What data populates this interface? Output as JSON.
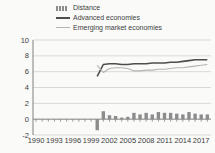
{
  "chart": {
    "background_color": "#fafaf9",
    "text_color": "#3d3d3d",
    "grid_color": "#d9d9d9",
    "axis_color": "#808080"
  },
  "chart_data": {
    "type": "bar+line combo",
    "title": "",
    "xlabel": "",
    "ylabel": "",
    "legend_position": "top-left",
    "grid": true,
    "x_axis": {
      "min": 1990,
      "max": 2018,
      "tick_labels": [
        "1990",
        "1993",
        "1996",
        "1999",
        "2002",
        "2005",
        "2008",
        "2011",
        "2014",
        "2017"
      ],
      "tick_step": 3
    },
    "y_axis": {
      "min": -2,
      "max": 10,
      "tick_step": 2,
      "tick_labels": [
        "-2",
        "0",
        "2",
        "4",
        "6",
        "8",
        "10"
      ]
    },
    "x": [
      2000,
      2001,
      2002,
      2003,
      2004,
      2005,
      2006,
      2007,
      2008,
      2009,
      2010,
      2011,
      2012,
      2013,
      2014,
      2015,
      2016,
      2017,
      2018
    ],
    "series": [
      {
        "name": "Distance",
        "type": "bar",
        "color": "#8c8c8c",
        "values": [
          -1.4,
          1.0,
          0.5,
          0.4,
          0.2,
          0.3,
          0.8,
          0.6,
          0.8,
          0.6,
          0.9,
          0.8,
          0.8,
          0.7,
          0.6,
          0.9,
          0.7,
          0.6,
          0.6
        ]
      },
      {
        "name": "Advanced economies",
        "type": "line",
        "color": "#4d4d4d",
        "values": [
          5.4,
          6.9,
          7.0,
          7.0,
          6.9,
          6.9,
          7.0,
          7.0,
          7.0,
          7.1,
          7.1,
          7.1,
          7.2,
          7.2,
          7.3,
          7.4,
          7.5,
          7.5,
          7.5
        ]
      },
      {
        "name": "Emerging market economies",
        "type": "line",
        "color": "#b3b3b3",
        "values": [
          6.8,
          5.9,
          6.4,
          6.5,
          6.5,
          6.4,
          6.1,
          6.1,
          6.2,
          6.2,
          6.3,
          6.3,
          6.4,
          6.5,
          6.5,
          6.6,
          6.7,
          6.8,
          6.9
        ]
      }
    ]
  }
}
